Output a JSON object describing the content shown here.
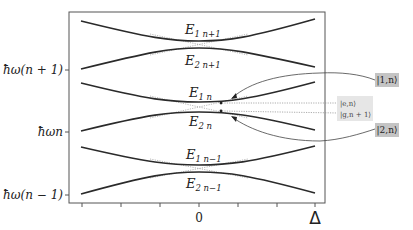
{
  "figure": {
    "type": "energy-level diagram (avoided crossings / dressed states)",
    "y_axis": {
      "ticks": [
        {
          "label": "ħω(n + 1)",
          "y": 70
        },
        {
          "label": "ħωn",
          "y": 132
        },
        {
          "label": "ħω(n − 1)",
          "y": 195
        }
      ]
    },
    "x_axis": {
      "labels": [
        {
          "label": "0",
          "x": 199
        },
        {
          "label": "Δ",
          "x": 315
        }
      ],
      "tick_positions": [
        82,
        121,
        160,
        199,
        238,
        277,
        315
      ]
    },
    "levels": [
      {
        "name": "E1 n+1",
        "main": "E",
        "sub": "1 n+1"
      },
      {
        "name": "E2 n+1",
        "main": "E",
        "sub": "2 n+1"
      },
      {
        "name": "E1 n",
        "main": "E",
        "sub": "1 n"
      },
      {
        "name": "E2 n",
        "main": "E",
        "sub": "2 n"
      },
      {
        "name": "E1 n-1",
        "main": "E",
        "sub": "1 n−1"
      },
      {
        "name": "E2 n-1",
        "main": "E",
        "sub": "2 n−1"
      }
    ],
    "state_labels": {
      "dressed_1": "|1,n⟩",
      "dressed_2": "|2,n⟩",
      "bare_e": "|e,n⟩",
      "bare_g": "|g,n + 1⟩"
    },
    "colors": {
      "curve": "#2a2a2a",
      "bare_dotted": "#8a8a8a",
      "label_box_dark": "#c4c4c4",
      "label_box_light": "#e6e6e6",
      "axis": "#555555"
    }
  }
}
